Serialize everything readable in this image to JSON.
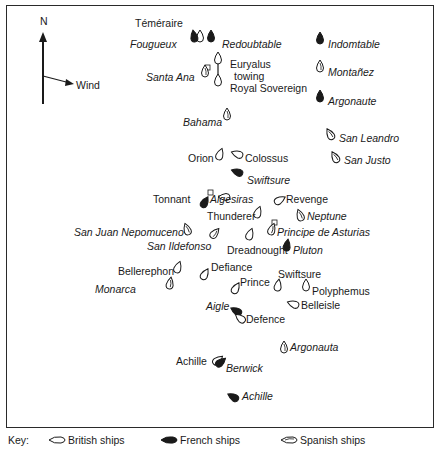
{
  "compass": {
    "north_label": "N",
    "wind_label": "Wind"
  },
  "ships": [
    {
      "name": "Téméraire",
      "nation": "british",
      "lx": 135,
      "ly": 17,
      "italic": false,
      "sx": 200,
      "sy": 36,
      "rot": 0
    },
    {
      "name": "Fougueux",
      "nation": "french",
      "lx": 130,
      "ly": 38,
      "italic": true,
      "sx": 194,
      "sy": 36,
      "rot": -10
    },
    {
      "name": "Redoubtable",
      "nation": "french",
      "lx": 222,
      "ly": 38,
      "italic": true,
      "sx": 211,
      "sy": 36,
      "rot": 0
    },
    {
      "name": "Indomtable",
      "nation": "french",
      "lx": 328,
      "ly": 38,
      "italic": true,
      "sx": 320,
      "sy": 38,
      "rot": 0
    },
    {
      "name": "Euryalus",
      "nation": "british",
      "lx": 230,
      "ly": 58,
      "italic": false,
      "sx": 218,
      "sy": 58,
      "rot": 0
    },
    {
      "name": "towing",
      "nation": "none",
      "lx": 234,
      "ly": 70,
      "italic": false
    },
    {
      "name": "Royal Sovereign",
      "nation": "british",
      "lx": 230,
      "ly": 82,
      "italic": false,
      "sx": 218,
      "sy": 80,
      "rot": 0
    },
    {
      "name": "Santa Ana",
      "nation": "spanish",
      "lx": 146,
      "ly": 71,
      "italic": true,
      "sx": 205,
      "sy": 71,
      "rot": 0
    },
    {
      "name": "Montañez",
      "nation": "spanish",
      "lx": 328,
      "ly": 66,
      "italic": true,
      "sx": 320,
      "sy": 66,
      "rot": 0
    },
    {
      "name": "Argonaute",
      "nation": "french",
      "lx": 328,
      "ly": 95,
      "italic": true,
      "sx": 320,
      "sy": 96,
      "rot": 0
    },
    {
      "name": "Bahama",
      "nation": "spanish",
      "lx": 183,
      "ly": 116,
      "italic": true,
      "sx": 227,
      "sy": 114,
      "rot": 0
    },
    {
      "name": "San Leandro",
      "nation": "spanish",
      "lx": 339,
      "ly": 132,
      "italic": true,
      "sx": 330,
      "sy": 134,
      "rot": -30
    },
    {
      "name": "Orion",
      "nation": "british",
      "lx": 188,
      "ly": 152,
      "italic": false,
      "sx": 220,
      "sy": 154,
      "rot": 20
    },
    {
      "name": "Colossus",
      "nation": "british",
      "lx": 245,
      "ly": 152,
      "italic": false,
      "sx": 237,
      "sy": 154,
      "rot": -70
    },
    {
      "name": "San Justo",
      "nation": "spanish",
      "lx": 344,
      "ly": 154,
      "italic": true,
      "sx": 335,
      "sy": 157,
      "rot": -30
    },
    {
      "name": "Swiftsure",
      "nation": "french",
      "lx": 247,
      "ly": 174,
      "italic": true,
      "sx": 237,
      "sy": 172,
      "rot": -70
    },
    {
      "name": "Tonnant",
      "nation": "british",
      "lx": 153,
      "ly": 193,
      "italic": false,
      "sx": 224,
      "sy": 197,
      "rot": -90
    },
    {
      "name": "Algesiras",
      "nation": "french",
      "lx": 210,
      "ly": 193,
      "italic": true,
      "sx": 205,
      "sy": 202,
      "rot": 30
    },
    {
      "name": "Revenge",
      "nation": "british",
      "lx": 286,
      "ly": 193,
      "italic": false,
      "sx": 280,
      "sy": 200,
      "rot": 60
    },
    {
      "name": "Thunderer",
      "nation": "british",
      "lx": 207,
      "ly": 210,
      "italic": false,
      "sx": 258,
      "sy": 212,
      "rot": 20
    },
    {
      "name": "Neptune",
      "nation": "spanish",
      "lx": 307,
      "ly": 210,
      "italic": true,
      "sx": 300,
      "sy": 215,
      "rot": -20
    },
    {
      "name": "San Juan Nepomuceno",
      "nation": "spanish",
      "lx": 74,
      "ly": 226,
      "italic": true,
      "sx": 187,
      "sy": 229,
      "rot": -20
    },
    {
      "name": "Principe de Asturias",
      "nation": "spanish",
      "lx": 277,
      "ly": 226,
      "italic": true,
      "sx": 272,
      "sy": 229,
      "rot": 20
    },
    {
      "name": "San Ildefonso",
      "nation": "spanish",
      "lx": 147,
      "ly": 240,
      "italic": true,
      "sx": 215,
      "sy": 233,
      "rot": 40
    },
    {
      "name": "Dreadnought",
      "nation": "british",
      "lx": 227,
      "ly": 244,
      "italic": false,
      "sx": 250,
      "sy": 234,
      "rot": 20
    },
    {
      "name": "Pluton",
      "nation": "french",
      "lx": 293,
      "ly": 244,
      "italic": true,
      "sx": 287,
      "sy": 245,
      "rot": 10
    },
    {
      "name": "Bellerephon",
      "nation": "british",
      "lx": 118,
      "ly": 265,
      "italic": false,
      "sx": 178,
      "sy": 267,
      "rot": 20
    },
    {
      "name": "Defiance",
      "nation": "british",
      "lx": 211,
      "ly": 261,
      "italic": false,
      "sx": 205,
      "sy": 274,
      "rot": 30
    },
    {
      "name": "Swiftsure",
      "nation": "british",
      "lx": 278,
      "ly": 268,
      "italic": false,
      "sx": 278,
      "sy": 285,
      "rot": 10
    },
    {
      "name": "Prince",
      "nation": "british",
      "lx": 240,
      "ly": 276,
      "italic": false,
      "sx": 236,
      "sy": 288,
      "rot": 30
    },
    {
      "name": "Polyphemus",
      "nation": "british",
      "lx": 312,
      "ly": 285,
      "italic": false,
      "sx": 306,
      "sy": 285,
      "rot": 0
    },
    {
      "name": "Monarca",
      "nation": "spanish",
      "lx": 95,
      "ly": 283,
      "italic": true,
      "sx": 170,
      "sy": 283,
      "rot": 10
    },
    {
      "name": "Aigle",
      "nation": "french",
      "lx": 206,
      "ly": 300,
      "italic": true,
      "sx": 236,
      "sy": 311,
      "rot": -60
    },
    {
      "name": "Belleisle",
      "nation": "british",
      "lx": 301,
      "ly": 299,
      "italic": false,
      "sx": 293,
      "sy": 304,
      "rot": -70
    },
    {
      "name": "Defence",
      "nation": "british",
      "lx": 246,
      "ly": 313,
      "italic": false,
      "sx": 240,
      "sy": 318,
      "rot": -50
    },
    {
      "name": "Argonauta",
      "nation": "spanish",
      "lx": 290,
      "ly": 341,
      "italic": true,
      "sx": 284,
      "sy": 347,
      "rot": 0
    },
    {
      "name": "Achille",
      "nation": "british",
      "lx": 176,
      "ly": 355,
      "italic": false,
      "sx": 218,
      "sy": 360,
      "rot": 50
    },
    {
      "name": "Berwick",
      "nation": "french",
      "lx": 226,
      "ly": 362,
      "italic": true,
      "sx": 221,
      "sy": 362,
      "rot": 50
    },
    {
      "name": "Achille",
      "nation": "french",
      "lx": 242,
      "ly": 390,
      "italic": true,
      "sx": 233,
      "sy": 397,
      "rot": -60
    }
  ],
  "key": {
    "label": "Key:",
    "items": [
      {
        "nation": "british",
        "label": "British ships"
      },
      {
        "nation": "french",
        "label": "French ships"
      },
      {
        "nation": "spanish",
        "label": "Spanish ships"
      }
    ]
  },
  "colors": {
    "ink": "#1a1a1a",
    "frame": "#2a2a2a",
    "background": "#ffffff"
  }
}
